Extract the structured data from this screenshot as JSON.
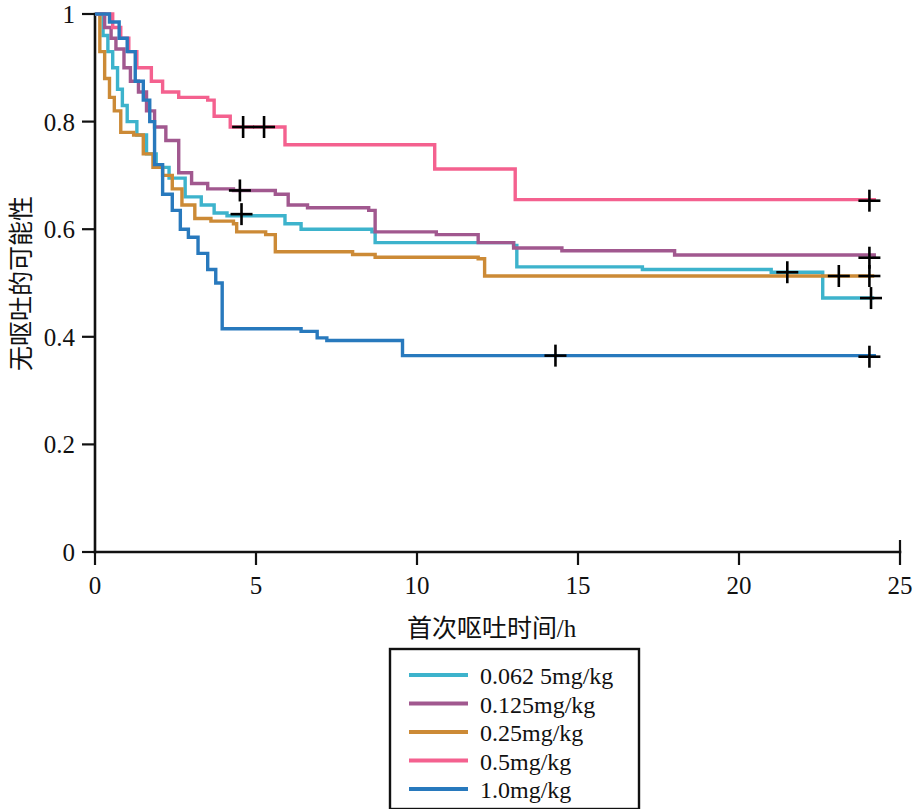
{
  "chart_data": {
    "type": "line",
    "subtype": "kaplan-meier-step",
    "title": "",
    "xlabel": "首次呕吐时间/h",
    "ylabel": "无呕吐的可能性",
    "xlim": [
      0,
      25
    ],
    "ylim": [
      0,
      1
    ],
    "xticks": [
      0,
      5,
      10,
      15,
      20,
      25
    ],
    "xtick_labels": [
      "0",
      "5",
      "10",
      "15",
      "20",
      "25"
    ],
    "yticks": [
      0,
      0.2,
      0.4,
      0.6,
      0.8,
      1
    ],
    "ytick_labels": [
      "0",
      "0.2",
      "0.4",
      "0.6",
      "0.8",
      "1"
    ],
    "grid": false,
    "legend_position": "bottom-center",
    "series": [
      {
        "name": "0.062 5mg/kg",
        "color": "#3db3cc",
        "steps": [
          [
            0.0,
            1.0
          ],
          [
            0.25,
            0.96
          ],
          [
            0.4,
            0.93
          ],
          [
            0.55,
            0.9
          ],
          [
            0.7,
            0.86
          ],
          [
            0.85,
            0.83
          ],
          [
            1.0,
            0.8
          ],
          [
            1.3,
            0.775
          ],
          [
            1.6,
            0.74
          ],
          [
            1.9,
            0.715
          ],
          [
            2.3,
            0.695
          ],
          [
            2.8,
            0.66
          ],
          [
            3.3,
            0.645
          ],
          [
            3.7,
            0.63
          ],
          [
            4.1,
            0.625
          ],
          [
            5.3,
            0.625
          ],
          [
            5.9,
            0.61
          ],
          [
            6.4,
            0.6
          ],
          [
            8.6,
            0.595
          ],
          [
            8.7,
            0.575
          ],
          [
            13.0,
            0.57
          ],
          [
            13.1,
            0.53
          ],
          [
            17.0,
            0.525
          ],
          [
            21.0,
            0.52
          ],
          [
            22.6,
            0.472
          ],
          [
            24.2,
            0.472
          ]
        ],
        "censor_points": [
          [
            4.55,
            0.628
          ],
          [
            21.5,
            0.52
          ],
          [
            24.1,
            0.472
          ]
        ]
      },
      {
        "name": "0.125mg/kg",
        "color": "#a1588f",
        "steps": [
          [
            0.0,
            1.0
          ],
          [
            0.3,
            0.975
          ],
          [
            0.5,
            0.955
          ],
          [
            0.65,
            0.935
          ],
          [
            0.9,
            0.9
          ],
          [
            1.1,
            0.875
          ],
          [
            1.35,
            0.855
          ],
          [
            1.6,
            0.82
          ],
          [
            1.85,
            0.79
          ],
          [
            2.2,
            0.765
          ],
          [
            2.6,
            0.705
          ],
          [
            3.0,
            0.685
          ],
          [
            3.5,
            0.675
          ],
          [
            4.3,
            0.672
          ],
          [
            5.6,
            0.665
          ],
          [
            6.0,
            0.645
          ],
          [
            6.6,
            0.64
          ],
          [
            8.5,
            0.635
          ],
          [
            8.7,
            0.595
          ],
          [
            10.6,
            0.59
          ],
          [
            11.9,
            0.575
          ],
          [
            13.0,
            0.565
          ],
          [
            14.5,
            0.56
          ],
          [
            18.0,
            0.552
          ],
          [
            24.2,
            0.547
          ]
        ],
        "censor_points": [
          [
            4.5,
            0.672
          ],
          [
            24.05,
            0.547
          ]
        ]
      },
      {
        "name": "0.25mg/kg",
        "color": "#cc8a36",
        "steps": [
          [
            0.0,
            1.0
          ],
          [
            0.15,
            0.93
          ],
          [
            0.3,
            0.88
          ],
          [
            0.45,
            0.845
          ],
          [
            0.6,
            0.82
          ],
          [
            0.8,
            0.78
          ],
          [
            1.2,
            0.775
          ],
          [
            1.5,
            0.74
          ],
          [
            1.8,
            0.715
          ],
          [
            2.1,
            0.7
          ],
          [
            2.4,
            0.675
          ],
          [
            2.7,
            0.645
          ],
          [
            3.1,
            0.62
          ],
          [
            3.6,
            0.615
          ],
          [
            4.3,
            0.61
          ],
          [
            4.4,
            0.595
          ],
          [
            5.3,
            0.59
          ],
          [
            5.6,
            0.558
          ],
          [
            8.0,
            0.553
          ],
          [
            8.7,
            0.548
          ],
          [
            11.9,
            0.545
          ],
          [
            12.1,
            0.513
          ],
          [
            24.2,
            0.513
          ]
        ],
        "censor_points": [
          [
            23.1,
            0.513
          ],
          [
            24.05,
            0.513
          ]
        ]
      },
      {
        "name": "0.5mg/kg",
        "color": "#f4618f",
        "steps": [
          [
            0.0,
            1.0
          ],
          [
            0.55,
            0.975
          ],
          [
            0.8,
            0.955
          ],
          [
            1.05,
            0.93
          ],
          [
            1.3,
            0.9
          ],
          [
            1.75,
            0.875
          ],
          [
            2.1,
            0.855
          ],
          [
            2.6,
            0.845
          ],
          [
            3.5,
            0.84
          ],
          [
            3.7,
            0.81
          ],
          [
            4.2,
            0.79
          ],
          [
            5.8,
            0.79
          ],
          [
            5.9,
            0.757
          ],
          [
            10.4,
            0.757
          ],
          [
            10.55,
            0.712
          ],
          [
            12.9,
            0.712
          ],
          [
            13.05,
            0.655
          ],
          [
            24.2,
            0.653
          ]
        ],
        "censor_points": [
          [
            4.6,
            0.79
          ],
          [
            5.25,
            0.79
          ],
          [
            24.05,
            0.653
          ]
        ]
      },
      {
        "name": "1.0mg/kg",
        "color": "#2879bd",
        "steps": [
          [
            0.0,
            1.0
          ],
          [
            0.45,
            0.985
          ],
          [
            0.75,
            0.955
          ],
          [
            1.0,
            0.93
          ],
          [
            1.25,
            0.875
          ],
          [
            1.5,
            0.84
          ],
          [
            1.7,
            0.8
          ],
          [
            1.85,
            0.72
          ],
          [
            2.1,
            0.665
          ],
          [
            2.4,
            0.635
          ],
          [
            2.65,
            0.6
          ],
          [
            2.9,
            0.585
          ],
          [
            3.2,
            0.555
          ],
          [
            3.5,
            0.525
          ],
          [
            3.75,
            0.5
          ],
          [
            3.95,
            0.415
          ],
          [
            6.4,
            0.41
          ],
          [
            6.9,
            0.398
          ],
          [
            7.2,
            0.393
          ],
          [
            9.55,
            0.365
          ],
          [
            24.2,
            0.363
          ]
        ],
        "censor_points": [
          [
            14.3,
            0.365
          ],
          [
            24.05,
            0.363
          ]
        ]
      }
    ]
  },
  "legend": {
    "items": [
      {
        "label": "0.062 5mg/kg",
        "color": "#3db3cc"
      },
      {
        "label": "0.125mg/kg",
        "color": "#a1588f"
      },
      {
        "label": "0.25mg/kg",
        "color": "#cc8a36"
      },
      {
        "label": "0.5mg/kg",
        "color": "#f4618f"
      },
      {
        "label": "1.0mg/kg",
        "color": "#2879bd"
      }
    ]
  }
}
